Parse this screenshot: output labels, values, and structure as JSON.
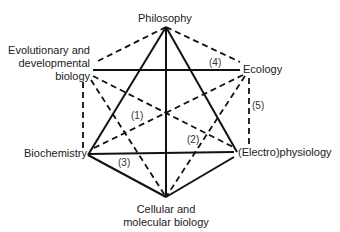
{
  "nodes": {
    "philosophy": {
      "label": "Philosophy"
    },
    "evo": {
      "line1": "Evolutionary and",
      "line2": "developmental",
      "line3": "biology"
    },
    "ecology": {
      "label": "Ecology"
    },
    "biochemistry": {
      "label": "Biochemistry"
    },
    "electrophysiology": {
      "label": "(Electro)physiology"
    },
    "cellular": {
      "line1": "Cellular and",
      "line2": "molecular biology"
    }
  },
  "edge_labels": {
    "e1": "(1)",
    "e2": "(2)",
    "e3": "(3)",
    "e4": "(4)",
    "e5": "(5)"
  },
  "colors": {
    "line": "#111111",
    "text": "#222222",
    "background": "#ffffff"
  }
}
